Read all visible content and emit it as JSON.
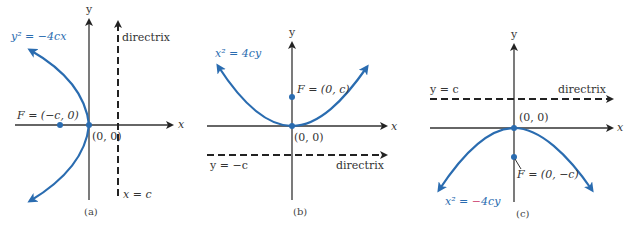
{
  "colors": {
    "curve": "#2a6cb0",
    "axis": "#333333",
    "directrix": "#222222",
    "minus_accent": "#d0507a"
  },
  "panels": [
    {
      "caption": "(a)",
      "equation": "y² = −4cx",
      "focus_label": "F = (−c, 0)",
      "vertex_label": "(0, 0)",
      "directrix_label": "directrix",
      "directrix_eq": "x = c",
      "x_axis_label": "x",
      "y_axis_label": "y"
    },
    {
      "caption": "(b)",
      "equation": "x² = 4cy",
      "focus_label": "F = (0, c)",
      "vertex_label": "(0, 0)",
      "directrix_label": "directrix",
      "directrix_eq": "y = −c",
      "x_axis_label": "x",
      "y_axis_label": "y"
    },
    {
      "caption": "(c)",
      "equation_prefix": "x² = ",
      "equation_minus": "−",
      "equation_suffix": "4cy",
      "focus_label": "F = (0, −c)",
      "vertex_label": "(0, 0)",
      "directrix_label": "directrix",
      "directrix_eq": "y = c",
      "x_axis_label": "x",
      "y_axis_label": "y"
    }
  ]
}
